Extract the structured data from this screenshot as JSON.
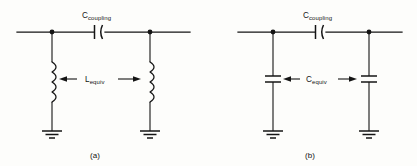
{
  "figure": {
    "title_caption_a": "(a)",
    "title_caption_b": "(b)",
    "background_color": "#fdfdfb",
    "line_color": "#141414"
  },
  "panels": [
    {
      "id": "panel-a",
      "caption": "(a)",
      "series_component": {
        "name": "coupling-capacitor",
        "symbol": "capacitor",
        "label_main": "C",
        "label_sub": "coupling"
      },
      "shunt_components": {
        "name": "equivalent-inductor",
        "symbol": "inductor",
        "label_main": "L",
        "label_sub": "equiv",
        "count": 2
      },
      "grounds": 2,
      "nodes": 2
    },
    {
      "id": "panel-b",
      "caption": "(b)",
      "series_component": {
        "name": "coupling-capacitor",
        "symbol": "capacitor",
        "label_main": "C",
        "label_sub": "coupling"
      },
      "shunt_components": {
        "name": "equivalent-capacitor",
        "symbol": "capacitor",
        "label_main": "C",
        "label_sub": "equiv",
        "count": 2
      },
      "grounds": 2,
      "nodes": 2
    }
  ]
}
